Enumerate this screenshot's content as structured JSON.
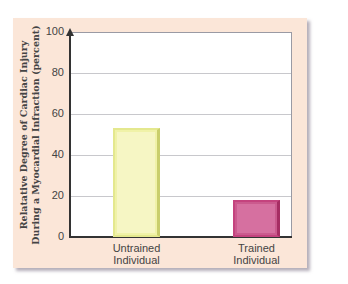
{
  "chart_data": {
    "type": "bar",
    "title": "",
    "categories": [
      "Untrained Individual",
      "Trained Individual"
    ],
    "category_lines": [
      [
        "Untrained",
        "Individual"
      ],
      [
        "Trained",
        "Individual"
      ]
    ],
    "values": [
      53,
      18
    ],
    "colors": [
      "#f6f6c4",
      "#d670a0"
    ],
    "xlabel": "",
    "ylabel": "Relatative Degree of Cardiac Injury During a Myocardial Infraction (percent)",
    "ylabel_lines": [
      "Relatative Degree of Cardiac Injury",
      "During a Myocardial Infraction (percent)"
    ],
    "ylim": [
      0,
      100
    ],
    "yticks": [
      0,
      20,
      40,
      60,
      80,
      100
    ],
    "grid": true,
    "legend": null
  }
}
